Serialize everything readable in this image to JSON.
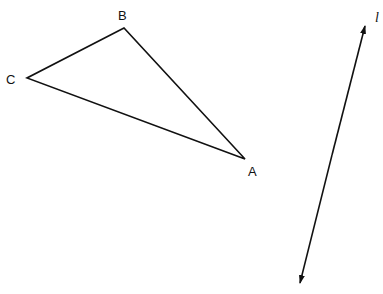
{
  "diagram": {
    "width": 383,
    "height": 294,
    "stroke_color": "#111111",
    "background": "#ffffff",
    "triangle": {
      "name": "Triangle ABC",
      "vertices": {
        "A": {
          "label": "A",
          "x": 245,
          "y": 159
        },
        "B": {
          "label": "B",
          "x": 124,
          "y": 28
        },
        "C": {
          "label": "C",
          "x": 27,
          "y": 78
        }
      }
    },
    "line": {
      "label": "l",
      "type": "bidirectional arrow line",
      "end1": {
        "x": 365,
        "y": 26
      },
      "end2": {
        "x": 300,
        "y": 283
      }
    }
  }
}
